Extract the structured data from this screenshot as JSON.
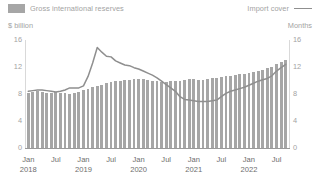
{
  "legend": {
    "series_bar_label": "Gross international reserves",
    "series_line_label": "Import cover",
    "bar_color": "#a6a6a6",
    "line_color": "#8f8f8f"
  },
  "axis_titles": {
    "left": "$ billion",
    "right": "Months"
  },
  "chart_data": {
    "type": "bar",
    "title": "",
    "subtitle": "",
    "xlabel": "",
    "ylabel": "$ billion",
    "y2label": "Months",
    "ylim": [
      0,
      16
    ],
    "y2lim": [
      0,
      16
    ],
    "yticks": [
      "0",
      "4",
      "8",
      "12",
      "16"
    ],
    "y2ticks": [
      "0",
      "4",
      "8",
      "12",
      "16"
    ],
    "grid": false,
    "legend_position": "top",
    "x_tick_labels": [
      {
        "month": "Jan",
        "year": "2018",
        "index": 0
      },
      {
        "month": "Jul",
        "year": "",
        "index": 6
      },
      {
        "month": "Jan",
        "year": "2019",
        "index": 12
      },
      {
        "month": "Jul",
        "year": "",
        "index": 18
      },
      {
        "month": "Jan",
        "year": "2020",
        "index": 24
      },
      {
        "month": "Jul",
        "year": "",
        "index": 30
      },
      {
        "month": "Jan",
        "year": "2021",
        "index": 36
      },
      {
        "month": "Jul",
        "year": "",
        "index": 42
      },
      {
        "month": "Jan",
        "year": "2022",
        "index": 48
      },
      {
        "month": "Jul",
        "year": "",
        "index": 54
      }
    ],
    "categories": [
      "Jan 2018",
      "Feb 2018",
      "Mar 2018",
      "Apr 2018",
      "May 2018",
      "Jun 2018",
      "Jul 2018",
      "Aug 2018",
      "Sep 2018",
      "Oct 2018",
      "Nov 2018",
      "Dec 2018",
      "Jan 2019",
      "Feb 2019",
      "Mar 2019",
      "Apr 2019",
      "May 2019",
      "Jun 2019",
      "Jul 2019",
      "Aug 2019",
      "Sep 2019",
      "Oct 2019",
      "Nov 2019",
      "Dec 2019",
      "Jan 2020",
      "Feb 2020",
      "Mar 2020",
      "Apr 2020",
      "May 2020",
      "Jun 2020",
      "Jul 2020",
      "Aug 2020",
      "Sep 2020",
      "Oct 2020",
      "Nov 2020",
      "Dec 2020",
      "Jan 2021",
      "Feb 2021",
      "Mar 2021",
      "Apr 2021",
      "May 2021",
      "Jun 2021",
      "Jul 2021",
      "Aug 2021",
      "Sep 2021",
      "Oct 2021",
      "Nov 2021",
      "Dec 2021",
      "Jan 2022",
      "Feb 2022",
      "Mar 2022",
      "Apr 2022",
      "May 2022",
      "Jun 2022",
      "Jul 2022",
      "Aug 2022",
      "Sep 2022"
    ],
    "series": [
      {
        "name": "Gross international reserves",
        "axis": "left",
        "render": "bar",
        "unit": "$ billion",
        "values": [
          8.2,
          8.3,
          8.4,
          8.3,
          8.2,
          8.2,
          8.3,
          8.2,
          8.1,
          8.0,
          8.1,
          8.3,
          8.6,
          8.8,
          9.0,
          9.2,
          9.4,
          9.6,
          9.8,
          9.9,
          10.0,
          10.1,
          10.1,
          10.2,
          10.2,
          10.2,
          10.1,
          10.0,
          9.9,
          9.8,
          9.8,
          9.9,
          9.9,
          10.0,
          10.1,
          10.2,
          10.2,
          10.1,
          10.1,
          10.2,
          10.3,
          10.4,
          10.5,
          10.6,
          10.7,
          10.8,
          10.9,
          11.0,
          11.1,
          11.2,
          11.4,
          11.6,
          11.8,
          12.0,
          12.4,
          12.7,
          13.0
        ]
      },
      {
        "name": "Import cover",
        "axis": "right",
        "render": "line",
        "unit": "Months",
        "values": [
          8.4,
          8.5,
          8.6,
          8.6,
          8.5,
          8.4,
          8.3,
          8.4,
          8.6,
          8.9,
          8.9,
          8.9,
          9.2,
          10.6,
          12.6,
          14.9,
          14.2,
          13.6,
          13.5,
          12.9,
          12.6,
          12.3,
          12.2,
          11.9,
          11.7,
          11.4,
          11.1,
          10.8,
          10.4,
          9.9,
          9.4,
          8.9,
          8.4,
          7.6,
          7.2,
          7.1,
          7.0,
          6.9,
          6.9,
          6.9,
          7.0,
          7.1,
          7.6,
          8.1,
          8.4,
          8.6,
          8.8,
          9.0,
          9.3,
          9.6,
          9.9,
          10.1,
          10.3,
          10.7,
          11.4,
          11.9,
          12.4
        ]
      }
    ]
  }
}
